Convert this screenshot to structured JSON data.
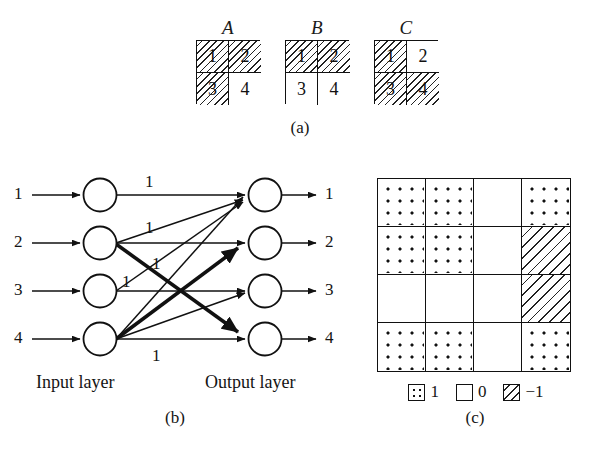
{
  "figure": {
    "captions": {
      "a": "(a)",
      "b": "(b)",
      "c": "(c)"
    }
  },
  "panel_a": {
    "patterns": [
      {
        "title": "A",
        "cells": [
          {
            "label": "1",
            "fill": "hatch"
          },
          {
            "label": "2",
            "fill": "hatch"
          },
          {
            "label": "3",
            "fill": "hatch"
          },
          {
            "label": "4",
            "fill": "blank"
          }
        ]
      },
      {
        "title": "B",
        "cells": [
          {
            "label": "1",
            "fill": "hatch"
          },
          {
            "label": "2",
            "fill": "hatch"
          },
          {
            "label": "3",
            "fill": "blank"
          },
          {
            "label": "4",
            "fill": "blank"
          }
        ]
      },
      {
        "title": "C",
        "cells": [
          {
            "label": "1",
            "fill": "hatch"
          },
          {
            "label": "2",
            "fill": "blank"
          },
          {
            "label": "3",
            "fill": "hatch"
          },
          {
            "label": "4",
            "fill": "hatch"
          }
        ]
      }
    ]
  },
  "panel_b": {
    "input_layer_label": "Input layer",
    "output_layer_label": "Output layer",
    "input_nodes": [
      "1",
      "2",
      "3",
      "4"
    ],
    "output_nodes": [
      "1",
      "2",
      "3",
      "4"
    ],
    "weight_labels": [
      "1",
      "1",
      "1",
      "1",
      "1"
    ],
    "connections": [
      {
        "from": 1,
        "to": 1,
        "weight": "1",
        "style": "thin"
      },
      {
        "from": 2,
        "to": 1,
        "weight": "1",
        "style": "thin"
      },
      {
        "from": 2,
        "to": 2,
        "weight": "",
        "style": "thin"
      },
      {
        "from": 2,
        "to": 4,
        "weight": "",
        "style": "thick"
      },
      {
        "from": 3,
        "to": 1,
        "weight": "1",
        "style": "thin"
      },
      {
        "from": 3,
        "to": 3,
        "weight": "",
        "style": "thin"
      },
      {
        "from": 4,
        "to": 1,
        "weight": "",
        "style": "thin"
      },
      {
        "from": 4,
        "to": 2,
        "weight": "",
        "style": "thick"
      },
      {
        "from": 4,
        "to": 3,
        "weight": "",
        "style": "thin"
      },
      {
        "from": 4,
        "to": 4,
        "weight": "1",
        "style": "thin"
      }
    ]
  },
  "panel_c": {
    "matrix": [
      [
        "1",
        "1",
        "0",
        "1"
      ],
      [
        "1",
        "1",
        "0",
        "-1"
      ],
      [
        "0",
        "0",
        "0",
        "-1"
      ],
      [
        "1",
        "1",
        "0",
        "1"
      ]
    ],
    "legend": [
      {
        "swatch": "dot",
        "label": "1"
      },
      {
        "swatch": "blank",
        "label": "0"
      },
      {
        "swatch": "hatch",
        "label": "−1"
      }
    ]
  },
  "colors": {
    "ink": "#111111",
    "paper": "#ffffff"
  }
}
